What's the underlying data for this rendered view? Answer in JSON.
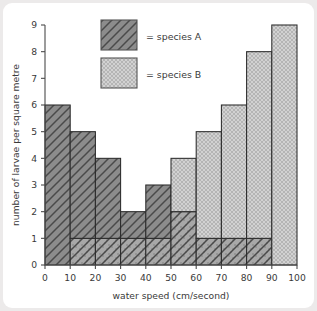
{
  "chart_data": {
    "type": "bar",
    "title": "",
    "xlabel": "water speed (cm/second)",
    "ylabel": "number of larvae per square metre",
    "categories": [
      "0-10",
      "10-20",
      "20-30",
      "30-40",
      "40-50",
      "50-60",
      "60-70",
      "70-80",
      "80-90",
      "90-100"
    ],
    "bin_edges": [
      0,
      10,
      20,
      30,
      40,
      50,
      60,
      70,
      80,
      90,
      100
    ],
    "x": [
      0,
      10,
      20,
      30,
      40,
      50,
      60,
      70,
      80,
      90,
      100
    ],
    "series": [
      {
        "name": "species A",
        "values": [
          6,
          5,
          4,
          2,
          3,
          2,
          1,
          1,
          1,
          0
        ],
        "pattern": "diagonal-hatch",
        "color": "#8c8c8c"
      },
      {
        "name": "species B",
        "values": [
          0,
          1,
          1,
          1,
          1,
          4,
          5,
          6,
          8,
          9
        ],
        "pattern": "dotted-stipple",
        "color": "#cfcfcf"
      }
    ],
    "xlim": [
      0,
      100
    ],
    "ylim": [
      0,
      9
    ],
    "xticks": [
      "0",
      "10",
      "20",
      "30",
      "40",
      "50",
      "60",
      "70",
      "80",
      "90",
      "100"
    ],
    "yticks": [
      "0",
      "1",
      "2",
      "3",
      "4",
      "5",
      "6",
      "7",
      "8",
      "9"
    ],
    "grid": false,
    "legend_position": "top-center",
    "legend": [
      {
        "label": "= species A",
        "key": "species A"
      },
      {
        "label": "= species B",
        "key": "species B"
      }
    ]
  },
  "colors": {
    "card_background": "#ffffff",
    "page_background": "#eceaea",
    "axis": "#4c4c4c",
    "text": "#3a3a3a",
    "series_a_fill": "#8c8c8c",
    "series_b_fill": "#cfcfcf",
    "bar_outline": "#2b2b2b"
  }
}
